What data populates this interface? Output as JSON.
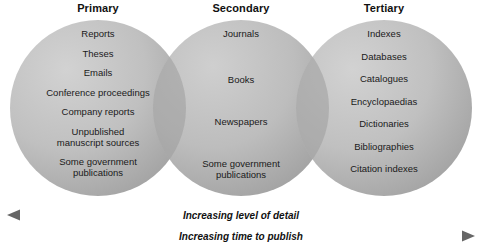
{
  "diagram": {
    "type": "venn",
    "title_row": {
      "primary": "Primary",
      "secondary": "Secondary",
      "tertiary": "Tertiary"
    },
    "circles": [
      {
        "id": "primary",
        "label": "Primary",
        "fill": "#b4b4b4",
        "items": [
          "Reports",
          "Theses",
          "Emails",
          "Conference proceedings",
          "Company reports",
          "Unpublished\nmanuscript sources",
          "Some government\npublications"
        ]
      },
      {
        "id": "secondary",
        "label": "Secondary",
        "fill": "#b4b4b4",
        "items": [
          "Journals",
          "Books",
          "Newspapers",
          "Some government\npublications"
        ]
      },
      {
        "id": "tertiary",
        "label": "Tertiary",
        "fill": "#b4b4b4",
        "items": [
          "Indexes",
          "Databases",
          "Catalogues",
          "Encyclopaedias",
          "Dictionaries",
          "Bibliographies",
          "Citation indexes"
        ]
      }
    ],
    "arrows": [
      {
        "id": "detail",
        "label": "Increasing level of detail",
        "direction": "left",
        "dark_color": "#6b6b6b",
        "light_color": "#d8d8d8"
      },
      {
        "id": "time",
        "label": "Increasing time to publish",
        "direction": "right",
        "dark_color": "#6b6b6b",
        "light_color": "#d8d8d8"
      }
    ],
    "colors": {
      "background": "#ffffff",
      "circle_light": "#c8c8c8",
      "circle_mid": "#b0b0b0",
      "circle_dark": "#9a9a9a",
      "text": "#1a1a1a"
    }
  }
}
